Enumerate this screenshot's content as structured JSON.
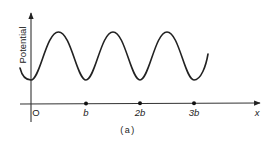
{
  "figure": {
    "caption": "(a)",
    "y_axis_label": "Potential",
    "x_axis_label": "x",
    "origin_label": "O",
    "ticks": [
      {
        "label": "b",
        "x": 86
      },
      {
        "label": "2b",
        "x": 140
      },
      {
        "label": "3b",
        "x": 194
      }
    ],
    "curve": {
      "type": "periodic potential (sinusoid)",
      "period_label": "b",
      "minima_at": [
        "0",
        "b",
        "2b",
        "3b"
      ],
      "peaks_count": 3
    },
    "colors": {
      "line": "#222222",
      "background": "#ffffff"
    }
  }
}
